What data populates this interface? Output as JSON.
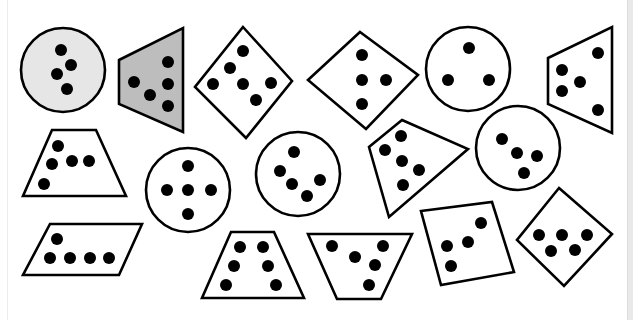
{
  "worksheet": {
    "title_fragment": "",
    "colors": {
      "stroke": "#000000",
      "dot": "#000000",
      "fill_white": "#ffffff",
      "fill_light_gray": "#e6e6e6",
      "fill_gray": "#bdbdbd",
      "right_edge": "#e9e9e9"
    },
    "shapes": [
      {
        "id": "circle-1",
        "type": "circle",
        "fill": "light-gray",
        "dot_count": 4
      },
      {
        "id": "quad-2",
        "type": "trapezoid",
        "fill": "gray",
        "dot_count": 5
      },
      {
        "id": "diamond-3",
        "type": "diamond",
        "fill": "white",
        "dot_count": 6
      },
      {
        "id": "diamond-4",
        "type": "diamond",
        "fill": "white",
        "dot_count": 4
      },
      {
        "id": "circle-5",
        "type": "circle",
        "fill": "white",
        "dot_count": 3
      },
      {
        "id": "quad-6",
        "type": "trapezoid",
        "fill": "white",
        "dot_count": 5
      },
      {
        "id": "trapezoid-7",
        "type": "trapezoid",
        "fill": "white",
        "dot_count": 5
      },
      {
        "id": "circle-8",
        "type": "circle",
        "fill": "white",
        "dot_count": 5
      },
      {
        "id": "circle-9",
        "type": "circle",
        "fill": "white",
        "dot_count": 5
      },
      {
        "id": "kite-10",
        "type": "quadrilateral",
        "fill": "white",
        "dot_count": 5
      },
      {
        "id": "circle-11",
        "type": "circle",
        "fill": "white",
        "dot_count": 4
      },
      {
        "id": "parallelogram-12",
        "type": "parallelogram",
        "fill": "white",
        "dot_count": 5
      },
      {
        "id": "trapezoid-13",
        "type": "trapezoid",
        "fill": "white",
        "dot_count": 6
      },
      {
        "id": "trapezoid-14",
        "type": "inverted-trapezoid",
        "fill": "white",
        "dot_count": 5
      },
      {
        "id": "square-15",
        "type": "square",
        "fill": "white",
        "dot_count": 4
      },
      {
        "id": "diamond-16",
        "type": "diamond",
        "fill": "white",
        "dot_count": 5
      }
    ]
  }
}
